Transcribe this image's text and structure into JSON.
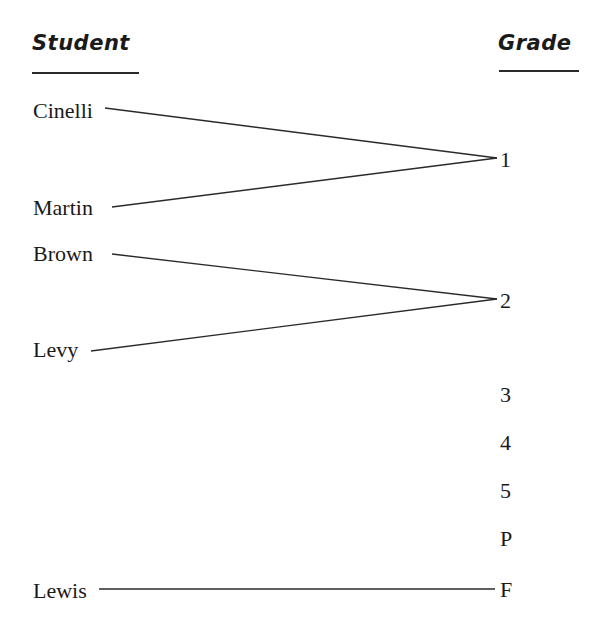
{
  "headers": {
    "student": "Student",
    "grade": "Grade"
  },
  "students": [
    {
      "name": "Cinelli",
      "grade": "1"
    },
    {
      "name": "Martin",
      "grade": "1"
    },
    {
      "name": "Brown",
      "grade": "2"
    },
    {
      "name": "Levy",
      "grade": "2"
    },
    {
      "name": "Lewis",
      "grade": "F"
    }
  ],
  "grades": [
    "1",
    "2",
    "3",
    "4",
    "5",
    "P",
    "F"
  ],
  "colors": {
    "text": "#1a1a1a",
    "line": "#2a2a2a",
    "background": "#ffffff"
  }
}
